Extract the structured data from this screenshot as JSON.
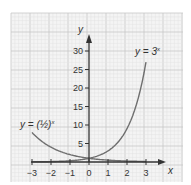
{
  "chart_data": {
    "type": "line",
    "title": "",
    "xlabel": "x",
    "ylabel": "y",
    "xlim": [
      -3,
      3
    ],
    "ylim": [
      0,
      30
    ],
    "x_ticks": [
      -3,
      -2,
      -1,
      0,
      1,
      2,
      3
    ],
    "x_tick_labels": [
      "−3",
      "−2",
      "−1",
      "0",
      "1",
      "2",
      "3"
    ],
    "y_ticks": [
      5,
      10,
      15,
      20,
      25,
      30
    ],
    "y_tick_labels": [
      "5",
      "10",
      "15",
      "20",
      "25",
      "30"
    ],
    "grid": true,
    "series": [
      {
        "name": "y = 3^x",
        "label_text": "y = 3",
        "label_exp": "x",
        "x": [
          -3,
          -2,
          -1,
          0,
          0.5,
          1,
          1.5,
          2,
          2.5,
          3
        ],
        "values": [
          0.037,
          0.111,
          0.333,
          1,
          1.73,
          3,
          5.2,
          9,
          15.59,
          27
        ]
      },
      {
        "name": "y = (1/2)^x",
        "label_text": "y = (½)",
        "label_exp": "x",
        "x": [
          -3,
          -2,
          -1,
          0,
          1,
          2,
          3
        ],
        "values": [
          8,
          4,
          2,
          1,
          0.5,
          0.25,
          0.125
        ]
      }
    ]
  },
  "colors": {
    "grid_minor": "#e2e2e2",
    "grid_major": "#c8c8c8",
    "axis": "#333333",
    "curve": "#6e6e6e"
  }
}
